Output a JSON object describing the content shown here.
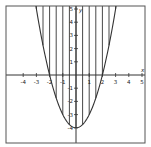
{
  "chart_data": {
    "type": "line",
    "title": "",
    "function": "y = x^2 - 4",
    "xlabel": "x",
    "ylabel": "y",
    "xlim": [
      -5,
      5
    ],
    "ylim": [
      -5,
      5
    ],
    "x_ticks": [
      -4,
      -3,
      -2,
      -1,
      1,
      2,
      3,
      4,
      5
    ],
    "y_ticks": [
      -4,
      -3,
      -2,
      -1,
      1,
      2,
      3,
      4,
      5
    ],
    "grid": false,
    "series": [
      {
        "name": "parabola",
        "x": [
          -3,
          -2,
          -1,
          0,
          1,
          2,
          3
        ],
        "values": [
          5,
          0,
          -3,
          -4,
          -3,
          0,
          5
        ]
      }
    ],
    "shading": {
      "style": "vertical-lines",
      "region": "above parabola (y >= x^2 - 4)",
      "line_x": [
        -3,
        -2.5,
        -2,
        -1.5,
        -1,
        -0.5,
        0,
        0.5,
        1,
        1.5,
        2,
        2.5,
        3
      ]
    }
  },
  "colors": {
    "curve": "#333333",
    "axis": "#333333",
    "frame": "#555555",
    "background": "#ffffff"
  }
}
